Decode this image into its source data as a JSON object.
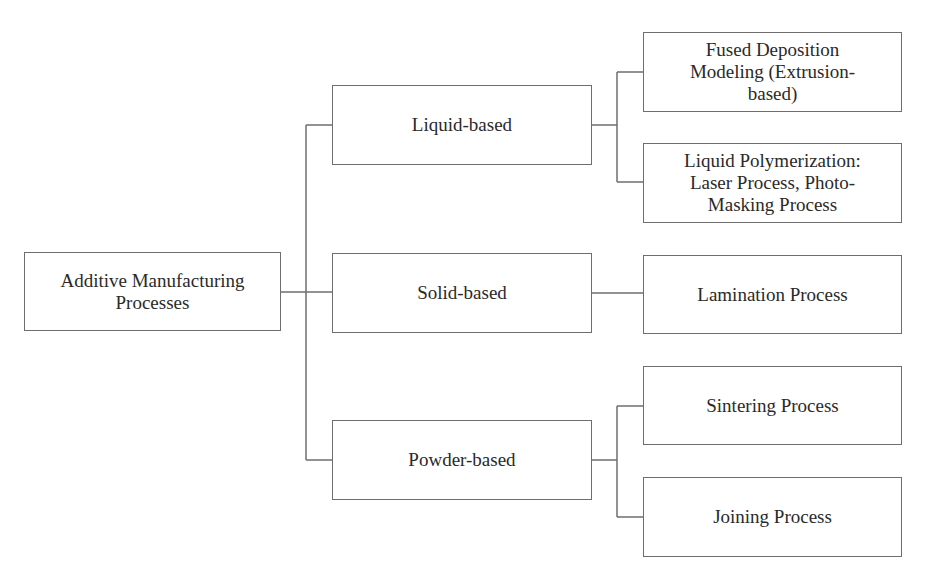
{
  "diagram": {
    "type": "tree",
    "orientation": "left-to-right",
    "root": {
      "id": "root",
      "label": "Additive Manufacturing\nProcesses"
    },
    "categories": [
      {
        "id": "liquid",
        "label": "Liquid-based",
        "children": [
          {
            "id": "fdm",
            "label": "Fused Deposition\nModeling (Extrusion-\nbased)"
          },
          {
            "id": "liquid-poly",
            "label": "Liquid Polymerization:\nLaser Process,  Photo-\nMasking Process"
          }
        ]
      },
      {
        "id": "solid",
        "label": "Solid-based",
        "children": [
          {
            "id": "lamination",
            "label": "Lamination Process"
          }
        ]
      },
      {
        "id": "powder",
        "label": "Powder-based",
        "children": [
          {
            "id": "sintering",
            "label": "Sintering Process"
          },
          {
            "id": "joining",
            "label": "Joining Process"
          }
        ]
      }
    ],
    "colors": {
      "border": "#6e6e6e",
      "text": "#2a2a2a",
      "background": "#ffffff"
    }
  }
}
